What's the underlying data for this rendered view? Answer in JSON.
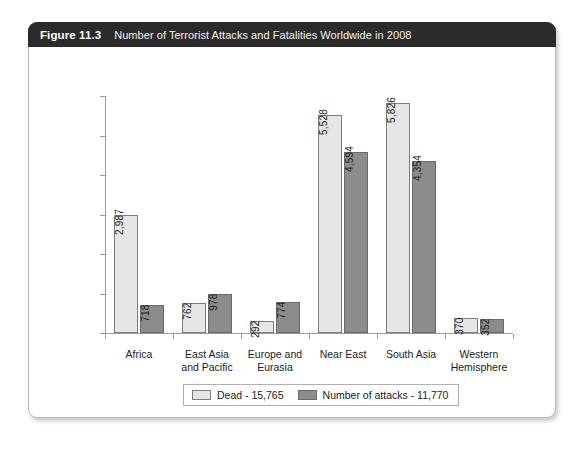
{
  "figure": {
    "number_label": "Figure 11.3",
    "title": "Number of Terrorist Attacks and Fatalities Worldwide in 2008"
  },
  "chart_data": {
    "type": "bar",
    "title": "Number of Terrorist Attacks and Fatalities Worldwide in 2008",
    "xlabel": "",
    "ylabel": "",
    "ylim": [
      0,
      6000
    ],
    "y_tick_count": 6,
    "y_tick_labels_shown": false,
    "grid": false,
    "legend_position": "bottom-center",
    "bar_label_orientation": "vertical",
    "categories": [
      "Africa",
      "East Asia\nand Pacific",
      "Europe and\nEurasia",
      "Near East",
      "South Asia",
      "Western\nHemisphere"
    ],
    "series": [
      {
        "name": "Dead - 15,765",
        "short_name": "Dead",
        "total": 15765,
        "color": "#e6e6e6",
        "values": [
          2987,
          762,
          292,
          5528,
          5826,
          370
        ],
        "labels": [
          "2,987",
          "762",
          "292",
          "5,528",
          "5,826",
          "370"
        ]
      },
      {
        "name": "Number of attacks - 11,770",
        "short_name": "Number of attacks",
        "total": 11770,
        "color": "#8c8c8c",
        "values": [
          718,
          978,
          774,
          4594,
          4354,
          352
        ],
        "labels": [
          "718",
          "978",
          "774",
          "4,594",
          "4,354",
          "352"
        ]
      }
    ]
  }
}
